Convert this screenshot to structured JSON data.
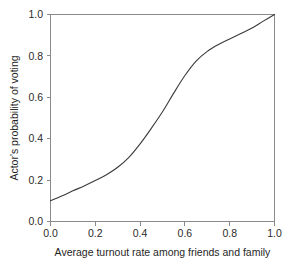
{
  "chart_data": {
    "type": "line",
    "title": "",
    "xlabel": "Average turnout rate among friends and family",
    "ylabel": "Actor's probability of voting",
    "xlim": [
      0.0,
      1.0
    ],
    "ylim": [
      0.0,
      1.0
    ],
    "grid": false,
    "legend": null,
    "xticks": [
      "0.0",
      "0.2",
      "0.4",
      "0.6",
      "0.8",
      "1.0"
    ],
    "xtick_values": [
      0.0,
      0.2,
      0.4,
      0.6,
      0.8,
      1.0
    ],
    "yticks": [
      "0.0",
      "0.2",
      "0.4",
      "0.6",
      "0.8",
      "1.0"
    ],
    "ytick_values": [
      0.0,
      0.2,
      0.4,
      0.6,
      0.8,
      1.0
    ],
    "series": [
      {
        "name": "Actor's probability of voting",
        "color": "#3a3a3a",
        "x": [
          0.0,
          0.05,
          0.1,
          0.15,
          0.2,
          0.25,
          0.3,
          0.35,
          0.4,
          0.45,
          0.5,
          0.55,
          0.6,
          0.65,
          0.7,
          0.75,
          0.8,
          0.85,
          0.9,
          0.95,
          1.0
        ],
        "y": [
          0.1,
          0.123,
          0.148,
          0.172,
          0.198,
          0.226,
          0.262,
          0.31,
          0.375,
          0.45,
          0.53,
          0.62,
          0.705,
          0.775,
          0.822,
          0.855,
          0.882,
          0.908,
          0.935,
          0.968,
          1.0
        ]
      }
    ]
  },
  "axes": {
    "ylabel": "Actor's probability of voting",
    "xlabel": "Average turnout rate among friends and family",
    "xtick_labels": [
      "0.0",
      "0.2",
      "0.4",
      "0.6",
      "0.8",
      "1.0"
    ],
    "ytick_labels": [
      "0.0",
      "0.2",
      "0.4",
      "0.6",
      "0.8",
      "1.0"
    ]
  },
  "colors": {
    "curve": "#3a3a3a",
    "frame": "#8a8a8a",
    "text": "#1f1f1f",
    "background": "#ffffff"
  }
}
